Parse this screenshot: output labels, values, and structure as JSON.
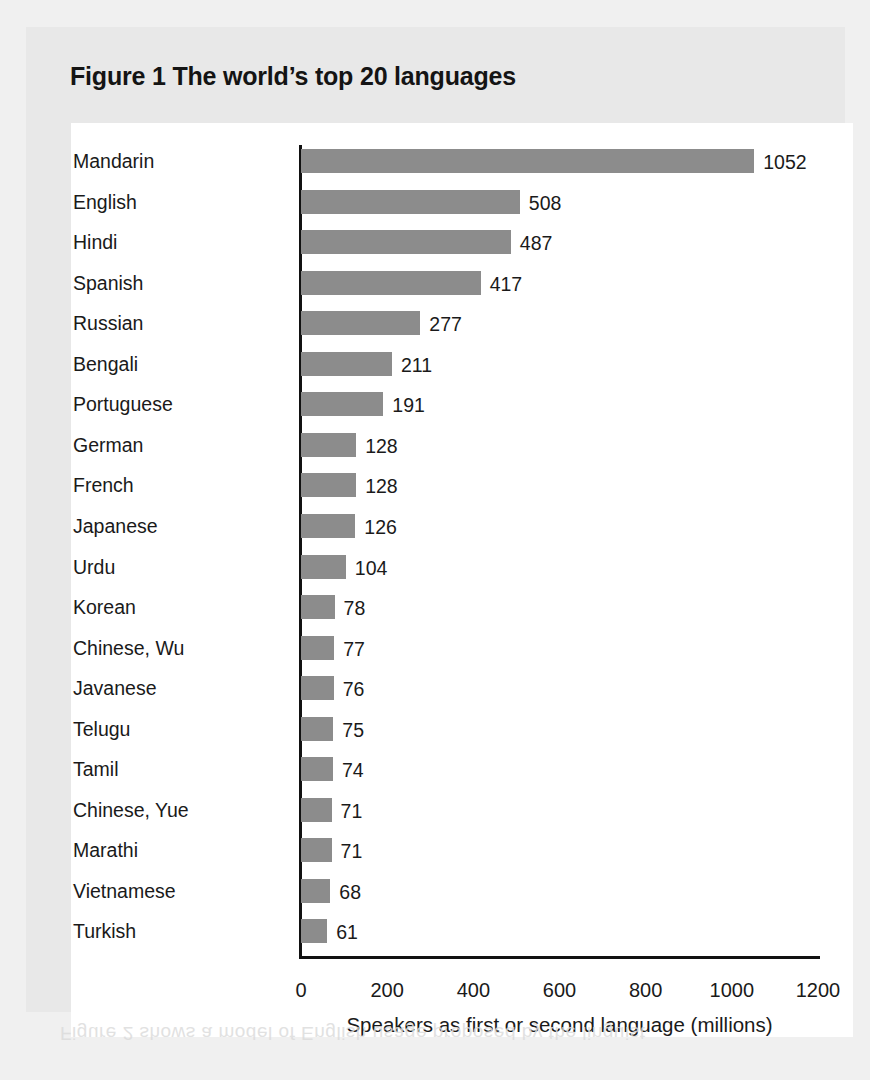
{
  "figure": {
    "title": "Figure 1 The world’s top 20 languages",
    "bleed_through": "Figure 2 shows a model of English usage proposed by the linguist"
  },
  "colors": {
    "bar_fill": "#8c8c8c",
    "axis": "#111111",
    "text": "#1a1a1a",
    "figure_box_bg": "#e8e8e8",
    "panel_bg": "#ffffff",
    "page_bg": "#f0f0f0"
  },
  "chart_data": {
    "type": "bar",
    "orientation": "horizontal",
    "title": "Figure 1 The world’s top 20 languages",
    "xlabel": "Speakers as first or second language (millions)",
    "ylabel": "",
    "xlim": [
      0,
      1200
    ],
    "xticks": [
      0,
      200,
      400,
      600,
      800,
      1000,
      1200
    ],
    "xtick_labels": [
      "0",
      "200",
      "400",
      "600",
      "800",
      "1000",
      "1200"
    ],
    "grid": false,
    "legend": false,
    "data_labels": true,
    "categories": [
      "Mandarin",
      "English",
      "Hindi",
      "Spanish",
      "Russian",
      "Bengali",
      "Portuguese",
      "German",
      "French",
      "Japanese",
      "Urdu",
      "Korean",
      "Chinese, Wu",
      "Javanese",
      "Telugu",
      "Tamil",
      "Chinese, Yue",
      "Marathi",
      "Vietnamese",
      "Turkish"
    ],
    "values": [
      1052,
      508,
      487,
      417,
      277,
      211,
      191,
      128,
      128,
      126,
      104,
      78,
      77,
      76,
      75,
      74,
      71,
      71,
      68,
      61
    ],
    "value_labels": [
      "1052",
      "508",
      "487",
      "417",
      "277",
      "211",
      "191",
      "128",
      "128",
      "126",
      "104",
      "78",
      "77",
      "76",
      "75",
      "74",
      "71",
      "71",
      "68",
      "61"
    ]
  }
}
